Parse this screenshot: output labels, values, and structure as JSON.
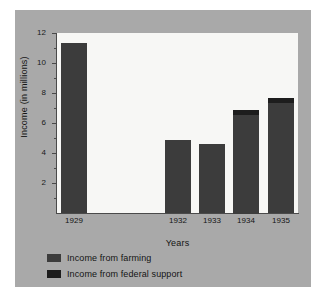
{
  "chart_data": {
    "type": "bar",
    "stacked": true,
    "title": "",
    "xlabel": "Years",
    "ylabel": "Income (in millions)",
    "categories": [
      "1929",
      "1930",
      "1931",
      "1932",
      "1933",
      "1934",
      "1935"
    ],
    "visible_tick_labels": [
      "1929",
      "",
      "",
      "1932",
      "1933",
      "1934",
      "1935"
    ],
    "series": [
      {
        "name": "Income from farming",
        "color": "#3c3c3c",
        "values": [
          11.3,
          0,
          0,
          4.85,
          4.6,
          6.6,
          7.35
        ]
      },
      {
        "name": "Income from federal support",
        "color": "#1d1d1d",
        "values": [
          0,
          0,
          0,
          0,
          0,
          0.3,
          0.35
        ]
      }
    ],
    "totals": [
      11.3,
      0,
      0,
      4.85,
      4.6,
      6.9,
      7.7
    ],
    "ylim": [
      0,
      12
    ],
    "ytick_major": [
      2,
      4,
      6,
      8,
      10,
      12
    ],
    "ytick_minor": [
      1,
      3,
      5,
      7,
      9,
      11
    ],
    "grid": false,
    "legend_position": "below-left",
    "panel_color": "#a9a9a9",
    "plot_background": "#f7f7f5",
    "axis_color": "#4a4a4a"
  },
  "legend": {
    "items": [
      {
        "label": "Income from farming"
      },
      {
        "label": "Income from federal support"
      }
    ]
  }
}
